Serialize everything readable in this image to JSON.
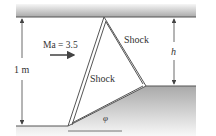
{
  "diagram": {
    "labels": {
      "mach": "Ma = 3.5",
      "shock_upper": "Shock",
      "shock_inner": "Shock",
      "height_total": "1 m",
      "height_step": "h",
      "angle": "φ"
    },
    "colors": {
      "wall_dark": "#8f8f8f",
      "wall_light": "#f4f4f4",
      "line": "#555555",
      "text": "#333333"
    }
  }
}
